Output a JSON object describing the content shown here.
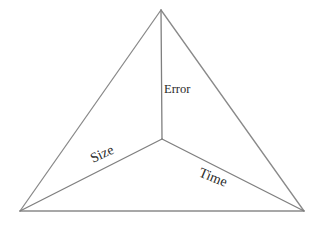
{
  "diagram": {
    "type": "tetrahedron-tradeoff",
    "vertices": {
      "apex": [
        161,
        10
      ],
      "center": [
        162,
        139
      ],
      "bottom_left": [
        20,
        211
      ],
      "bottom_right": [
        304,
        211
      ]
    },
    "axes": [
      {
        "id": "error",
        "label": "Error",
        "from": "center",
        "to": "apex"
      },
      {
        "id": "size",
        "label": "Size",
        "from": "center",
        "to": "bottom_left"
      },
      {
        "id": "time",
        "label": "Time",
        "from": "center",
        "to": "bottom_right"
      }
    ],
    "colors": {
      "line": "#8a8a8a",
      "text": "#2a2a2a",
      "background": "#ffffff"
    }
  }
}
